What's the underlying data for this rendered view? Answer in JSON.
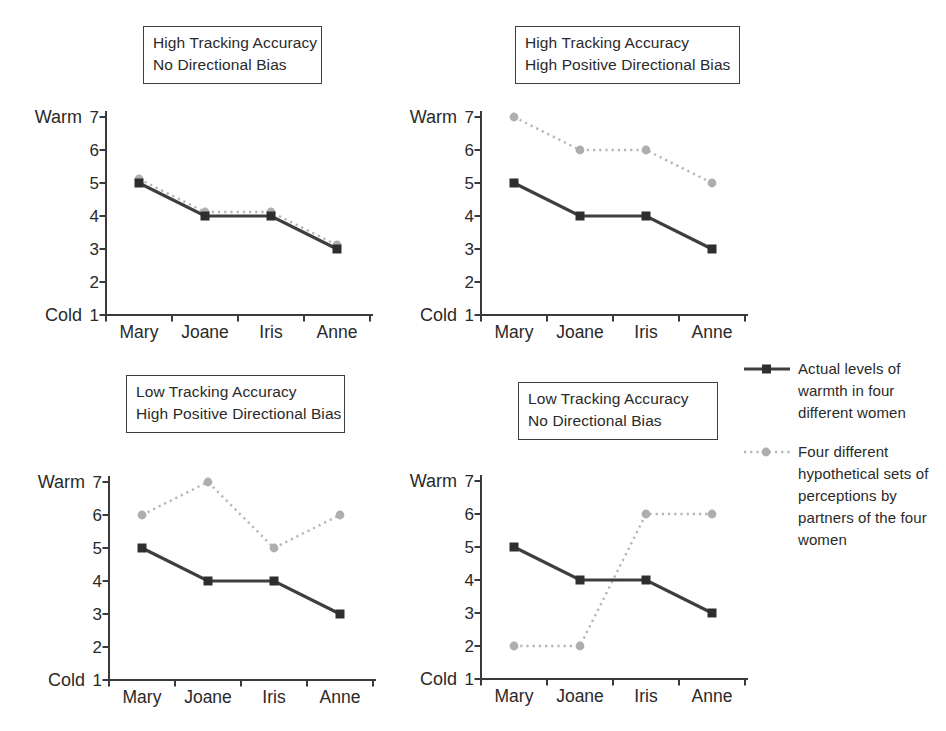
{
  "figure": {
    "description_note": "2x2 panel line-chart figure comparing tracking accuracy and directional bias in perceptions of warmth"
  },
  "axis": {
    "warm_label": "Warm",
    "cold_label": "Cold",
    "y_ticks": [
      7,
      6,
      5,
      4,
      3,
      2,
      1
    ],
    "y_min": 1,
    "y_max": 7,
    "categories": [
      "Mary",
      "Joane",
      "Iris",
      "Anne"
    ]
  },
  "colors": {
    "actual_line": "#3e3e40",
    "actual_marker": "#2e2e30",
    "hypothetical_line": "#b6b6b6",
    "hypothetical_marker": "#aeaeae",
    "axis_line": "#3a3a3a",
    "text": "#2a2a2a",
    "box_border": "#3f3f3f"
  },
  "legend": {
    "items": [
      {
        "name": "actual",
        "marker": "solid-line-square",
        "label": "Actual levels of warmth in four different women",
        "label_lines": [
          "Actual levels of",
          "warmth in four",
          "different women"
        ]
      },
      {
        "name": "hypothetical",
        "marker": "dotted-line-circle",
        "label": "Four different hypothetical sets of perceptions by partners of the four women",
        "label_lines": [
          "Four different",
          "hypothetical sets of",
          "perceptions by",
          "partners of the four",
          "women"
        ]
      }
    ]
  },
  "chart_data": [
    {
      "type": "line",
      "position": "top-left",
      "title_lines": [
        "High Tracking Accuracy",
        "No Directional Bias"
      ],
      "categories": [
        "Mary",
        "Joane",
        "Iris",
        "Anne"
      ],
      "ylim": [
        1,
        7
      ],
      "ylabel_top": "Warm",
      "ylabel_bottom": "Cold",
      "series": [
        {
          "name": "Actual levels of warmth in four different women",
          "style": "solid-square",
          "values": [
            5,
            4,
            4,
            3
          ]
        },
        {
          "name": "Four different hypothetical sets of perceptions by partners of the four women",
          "style": "dotted-circle",
          "values": [
            5,
            4,
            4,
            3
          ],
          "draw_offset_px": -4
        }
      ]
    },
    {
      "type": "line",
      "position": "top-right",
      "title_lines": [
        "High Tracking Accuracy",
        "High Positive Directional Bias"
      ],
      "categories": [
        "Mary",
        "Joane",
        "Iris",
        "Anne"
      ],
      "ylim": [
        1,
        7
      ],
      "ylabel_top": "Warm",
      "ylabel_bottom": "Cold",
      "series": [
        {
          "name": "Actual levels of warmth in four different women",
          "style": "solid-square",
          "values": [
            5,
            4,
            4,
            3
          ]
        },
        {
          "name": "Four different hypothetical sets of perceptions by partners of the four women",
          "style": "dotted-circle",
          "values": [
            7,
            6,
            6,
            5
          ],
          "draw_offset_px": 0
        }
      ]
    },
    {
      "type": "line",
      "position": "bottom-left",
      "title_lines": [
        "Low Tracking Accuracy",
        "High Positive Directional Bias"
      ],
      "categories": [
        "Mary",
        "Joane",
        "Iris",
        "Anne"
      ],
      "ylim": [
        1,
        7
      ],
      "ylabel_top": "Warm",
      "ylabel_bottom": "Cold",
      "series": [
        {
          "name": "Actual levels of warmth in four different women",
          "style": "solid-square",
          "values": [
            5,
            4,
            4,
            3
          ]
        },
        {
          "name": "Four different hypothetical sets of perceptions by partners of the four women",
          "style": "dotted-circle",
          "values": [
            6,
            7,
            5,
            6
          ],
          "draw_offset_px": 0
        }
      ]
    },
    {
      "type": "line",
      "position": "bottom-right",
      "title_lines": [
        "Low Tracking Accuracy",
        "No Directional Bias"
      ],
      "categories": [
        "Mary",
        "Joane",
        "Iris",
        "Anne"
      ],
      "ylim": [
        1,
        7
      ],
      "ylabel_top": "Warm",
      "ylabel_bottom": "Cold",
      "series": [
        {
          "name": "Actual levels of warmth in four different women",
          "style": "solid-square",
          "values": [
            5,
            4,
            4,
            3
          ]
        },
        {
          "name": "Four different hypothetical sets of perceptions by partners of the four women",
          "style": "dotted-circle",
          "values": [
            2,
            2,
            6,
            6
          ],
          "draw_offset_px": 0
        }
      ]
    }
  ]
}
